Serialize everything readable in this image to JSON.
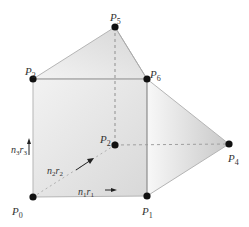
{
  "diagram": {
    "points": [
      {
        "id": "P0",
        "label": "P",
        "sub": "0",
        "x": 33,
        "y": 197,
        "lx": 12,
        "ly": 215
      },
      {
        "id": "P1",
        "label": "P",
        "sub": "1",
        "x": 147,
        "y": 196,
        "lx": 142,
        "ly": 215
      },
      {
        "id": "P2",
        "label": "P",
        "sub": "2",
        "x": 115,
        "y": 145,
        "lx": 100,
        "ly": 143
      },
      {
        "id": "P3",
        "label": "P",
        "sub": "3",
        "x": 33,
        "y": 79,
        "lx": 25,
        "ly": 75
      },
      {
        "id": "P4",
        "label": "P",
        "sub": "4",
        "x": 229,
        "y": 144,
        "lx": 228,
        "ly": 162
      },
      {
        "id": "P5",
        "label": "P",
        "sub": "5",
        "x": 115,
        "y": 27,
        "lx": 110,
        "ly": 21
      },
      {
        "id": "P6",
        "label": "P",
        "sub": "6",
        "x": 147,
        "y": 79,
        "lx": 150,
        "ly": 78
      }
    ],
    "vectors": [
      {
        "id": "n1r1",
        "text": "n",
        "sub1": "1",
        "text2": "r",
        "sub2": "1",
        "x": 78,
        "y": 195
      },
      {
        "id": "n2r2",
        "text": "n",
        "sub1": "2",
        "text2": "r",
        "sub2": "2",
        "x": 47,
        "y": 174
      },
      {
        "id": "n3r3",
        "text": "n",
        "sub1": "3",
        "text2": "r",
        "sub2": "3",
        "x": 11,
        "y": 153
      }
    ],
    "colors": {
      "point": "#111111",
      "edge": "#b5b5b5",
      "dashed": "#9a9a9a",
      "fill_light": "#f4f4f4",
      "fill_dark": "#cfcfcf",
      "arrow": "#222222"
    }
  }
}
